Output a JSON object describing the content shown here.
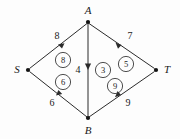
{
  "figure": {
    "kind": "flow-network-diagram",
    "background_color": "#fdfdfd",
    "ink_color": "#1a1a1a",
    "width": 180,
    "height": 139
  },
  "vertices": [
    {
      "id": "S",
      "label": "S",
      "x": 28,
      "y": 70,
      "label_x": 17,
      "label_y": 73,
      "role": "source"
    },
    {
      "id": "A",
      "label": "A",
      "x": 88,
      "y": 22,
      "label_x": 88,
      "label_y": 13,
      "role": "intermediate"
    },
    {
      "id": "B",
      "label": "B",
      "x": 88,
      "y": 118,
      "label_x": 88,
      "label_y": 133,
      "role": "intermediate"
    },
    {
      "id": "T",
      "label": "T",
      "x": 156,
      "y": 70,
      "label_x": 167,
      "label_y": 73,
      "role": "sink"
    }
  ],
  "edges": [
    {
      "id": "S-A",
      "from": "S",
      "to": "A",
      "capacity": "8",
      "flow": "8",
      "capacity_x": 57,
      "capacity_y": 39,
      "flow_x": 63,
      "flow_y": 60
    },
    {
      "id": "A-T",
      "from": "A",
      "to": "T",
      "capacity": "7",
      "flow": "5",
      "capacity_x": 130,
      "capacity_y": 39,
      "flow_x": 126,
      "flow_y": 64
    },
    {
      "id": "A-B",
      "from": "A",
      "to": "B",
      "capacity": "4",
      "flow": "3",
      "capacity_x": 78,
      "capacity_y": 73,
      "flow_x": 103,
      "flow_y": 70
    },
    {
      "id": "B-S",
      "from": "B",
      "to": "S",
      "capacity": "6",
      "flow": "6",
      "capacity_x": 52,
      "capacity_y": 106,
      "flow_x": 63,
      "flow_y": 82
    },
    {
      "id": "B-T",
      "from": "B",
      "to": "T",
      "capacity": "9",
      "flow": "9",
      "capacity_x": 128,
      "capacity_y": 106,
      "flow_x": 115,
      "flow_y": 86
    }
  ]
}
